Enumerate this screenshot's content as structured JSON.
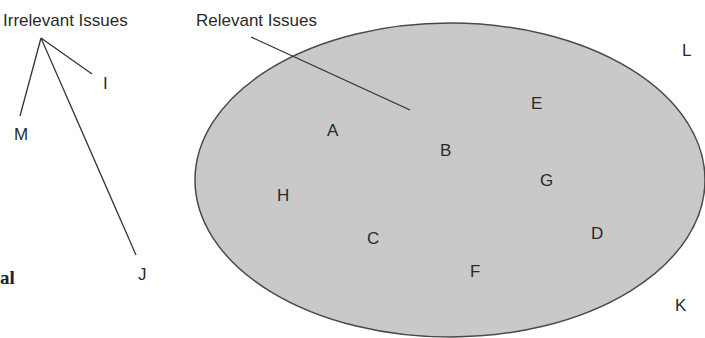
{
  "diagram": {
    "labels": {
      "irrelevant_group": "Irrelevant Issues",
      "relevant_group": "Relevant Issues"
    },
    "fragment_text": "al",
    "colors": {
      "ellipse_fill": "#c9c9c9",
      "ellipse_stroke": "#4a4a4a",
      "line": "#333333",
      "text": "#2a2a2a"
    },
    "relevant_items": [
      "A",
      "B",
      "C",
      "D",
      "E",
      "F",
      "G",
      "H"
    ],
    "irrelevant_items": [
      "I",
      "J",
      "K",
      "L",
      "M"
    ],
    "items": {
      "A": "A",
      "B": "B",
      "C": "C",
      "D": "D",
      "E": "E",
      "F": "F",
      "G": "G",
      "H": "H",
      "I": "I",
      "J": "J",
      "K": "K",
      "L": "L",
      "M": "M"
    }
  }
}
